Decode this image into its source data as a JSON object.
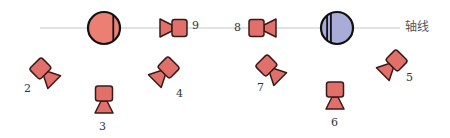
{
  "diagram": {
    "axis": {
      "label": "轴线",
      "y": 28,
      "x_start": 40,
      "x_end": 400,
      "color": "#d8d8d8"
    },
    "colors": {
      "camera_fill": "#e2706a",
      "camera_stroke": "#3a1a18",
      "left_sphere_fill": "#ec7f74",
      "right_sphere_fill": "#a9acd8",
      "outline": "#111111"
    },
    "spheres": [
      {
        "id": "left-sphere",
        "cx": 104,
        "cy": 28,
        "r": 16,
        "fill": "#ec7f74",
        "stripes": 1
      },
      {
        "id": "right-sphere",
        "cx": 337,
        "cy": 28,
        "r": 16,
        "fill": "#a9acd8",
        "stripes": 2
      }
    ],
    "cameras": [
      {
        "label": "2",
        "cx": 45,
        "cy": 73,
        "rotate": -135,
        "label_x": 24,
        "label_y": 83
      },
      {
        "label": "3",
        "cx": 104,
        "cy": 100,
        "rotate": -90,
        "label_x": 99,
        "label_y": 121
      },
      {
        "label": "4",
        "cx": 164,
        "cy": 72,
        "rotate": -45,
        "label_x": 176,
        "label_y": 88
      },
      {
        "label": "5",
        "cx": 392,
        "cy": 65,
        "rotate": -45,
        "label_x": 406,
        "label_y": 72
      },
      {
        "label": "6",
        "cx": 335,
        "cy": 96,
        "rotate": -90,
        "label_x": 331,
        "label_y": 117
      },
      {
        "label": "7",
        "cx": 271,
        "cy": 70,
        "rotate": -135,
        "label_x": 257,
        "label_y": 82
      },
      {
        "label": "8",
        "cx": 263,
        "cy": 28,
        "rotate": 180,
        "label_x": 234,
        "label_y": 22
      },
      {
        "label": "9",
        "cx": 173,
        "cy": 28,
        "rotate": 0,
        "label_x": 192,
        "label_y": 20
      }
    ]
  }
}
